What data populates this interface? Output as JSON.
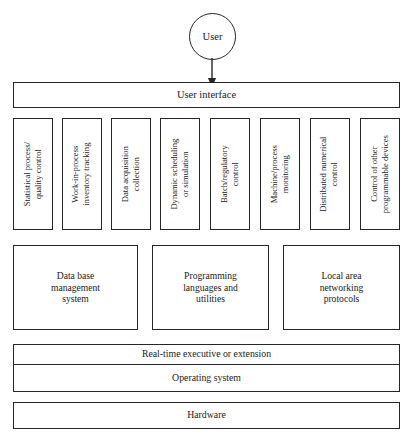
{
  "figure": {
    "type": "layered-architecture-diagram",
    "actor": {
      "label": "User",
      "shape": "circle",
      "connector": "arrow-down"
    },
    "layers": [
      {
        "name": "user-interface",
        "label": "User interface"
      },
      {
        "name": "applications",
        "orientation": "vertical-text",
        "items": [
          "Statistical process/\nquality control",
          "Work-in-process\ninventory tracking",
          "Data acquisition\ncollection",
          "Dynamic scheduling\nor simulation",
          "Batch/regulatory\ncontrol",
          "Machine/process\nmonitoring",
          "Distributed numerical\ncontrol",
          "Control of other\nprogrammable devices"
        ]
      },
      {
        "name": "services",
        "items": [
          "Data base\nmanagement\nsystem",
          "Programming\nlanguages and\nutilities",
          "Local area\nnetworking\nprotocols"
        ]
      },
      {
        "name": "system-software",
        "items": [
          "Real-time executive or extension",
          "Operating system"
        ]
      },
      {
        "name": "hardware",
        "label": "Hardware"
      }
    ],
    "colors": {
      "stroke": "#262626",
      "fill": "#ffffff",
      "text": "#1a1a1a"
    }
  },
  "applications": {
    "items": [
      {
        "line1": "Statistical process/",
        "line2": "quality control"
      },
      {
        "line1": "Work-in-process",
        "line2": "inventory tracking"
      },
      {
        "line1": "Data acquisition",
        "line2": "collection"
      },
      {
        "line1": "Dynamic scheduling",
        "line2": "or simulation"
      },
      {
        "line1": "Batch/regulatory",
        "line2": "control"
      },
      {
        "line1": "Machine/process",
        "line2": "monitoring"
      },
      {
        "line1": "Distributed numerical",
        "line2": "control"
      },
      {
        "line1": "Control of other",
        "line2": "programmable devices"
      }
    ]
  },
  "services": {
    "items": [
      {
        "line1": "Data base",
        "line2": "management",
        "line3": "system"
      },
      {
        "line1": "Programming",
        "line2": "languages and",
        "line3": "utilities"
      },
      {
        "line1": "Local area",
        "line2": "networking",
        "line3": "protocols"
      }
    ]
  },
  "user": {
    "label": "User"
  },
  "user_interface": {
    "label": "User interface"
  },
  "system": {
    "realtime_label": "Real-time executive or extension",
    "os_label": "Operating system"
  },
  "hardware": {
    "label": "Hardware"
  }
}
